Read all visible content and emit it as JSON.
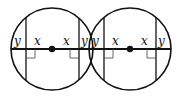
{
  "diagram": {
    "stroke_color": "#111111",
    "background": "#ffffff",
    "circles": [
      {
        "cx": 52,
        "cy": 49,
        "r": 41,
        "center_dot": true,
        "labels": {
          "left_y": "y",
          "left_x": "x",
          "right_x": "x",
          "right_y": "y"
        }
      },
      {
        "cx": 130,
        "cy": 49,
        "r": 41,
        "center_dot": true,
        "labels": {
          "left_y": "y",
          "left_x": "x",
          "right_x": "x",
          "right_y": "y"
        }
      }
    ]
  }
}
